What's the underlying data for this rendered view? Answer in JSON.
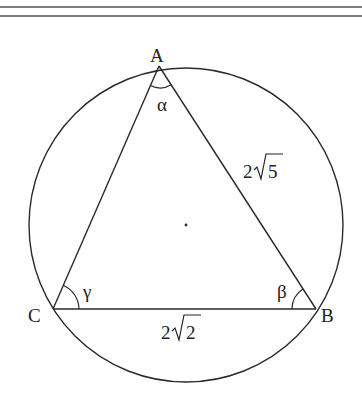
{
  "diagram": {
    "type": "inscribed-triangle",
    "circle": {
      "cx": 186,
      "cy": 225,
      "r": 157,
      "center_marker": "dot"
    },
    "vertices": {
      "A": {
        "label": "A",
        "x": 159,
        "y": 66
      },
      "B": {
        "label": "B",
        "x": 316,
        "y": 309
      },
      "C": {
        "label": "C",
        "x": 53,
        "y": 309
      }
    },
    "angles": {
      "alpha": {
        "label": "α",
        "vertex": "A"
      },
      "beta": {
        "label": "β",
        "vertex": "B"
      },
      "gamma": {
        "label": "γ",
        "vertex": "C"
      }
    },
    "sides": {
      "AB": {
        "label_coef": "2",
        "label_rad": "5",
        "label": "2√5"
      },
      "BC": {
        "label_coef": "2",
        "label_rad": "2",
        "label": "2√2"
      }
    },
    "colors": {
      "stroke": "#2a2a2a",
      "rule": "#555555",
      "background": "#ffffff"
    }
  }
}
